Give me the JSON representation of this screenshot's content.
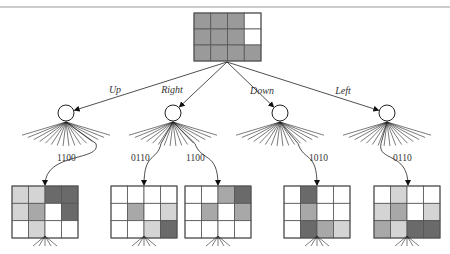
{
  "shade_colors": {
    "W": "#ffffff",
    "L": "#d4d4d4",
    "M": "#a8a8a8",
    "G": "#9a9a9a",
    "D": "#6a6a6a"
  },
  "root": {
    "name": "root-state",
    "x": 194,
    "y": 13,
    "w": 67,
    "h": 48,
    "cells": [
      [
        "G",
        "G",
        "G",
        "W"
      ],
      [
        "G",
        "G",
        "G",
        "W"
      ],
      [
        "G",
        "G",
        "G",
        "G"
      ]
    ],
    "apex": [
      227,
      62
    ]
  },
  "actions": [
    {
      "label": "Up",
      "label_pos": [
        115,
        93
      ],
      "node": [
        66,
        113
      ]
    },
    {
      "label": "Right",
      "label_pos": [
        172,
        93
      ],
      "node": [
        173,
        113
      ]
    },
    {
      "label": "Down",
      "label_pos": [
        262,
        94
      ],
      "node": [
        280,
        113
      ]
    },
    {
      "label": "Left",
      "label_pos": [
        343,
        94
      ],
      "node": [
        387,
        113
      ]
    }
  ],
  "node_radius": 8,
  "fan": {
    "half_width": 44,
    "drop": 24,
    "count": 16
  },
  "branches": [
    {
      "node": 0,
      "code": "1100",
      "code_pos": [
        57,
        161
      ],
      "from_offset": 30,
      "target": 0
    },
    {
      "node": 1,
      "code": "0110",
      "code_pos": [
        131,
        161
      ],
      "from_offset": -12,
      "target": 1
    },
    {
      "node": 1,
      "code": "1100",
      "code_pos": [
        186,
        161
      ],
      "from_offset": 22,
      "target": 2
    },
    {
      "node": 2,
      "code": "1010",
      "code_pos": [
        309,
        161
      ],
      "from_offset": 18,
      "target": 3
    },
    {
      "node": 3,
      "code": "0110",
      "code_pos": [
        393,
        161
      ],
      "from_offset": -6,
      "target": 4
    }
  ],
  "children": [
    {
      "name": "child-up",
      "x": 12,
      "y": 186,
      "w": 66,
      "h": 52,
      "arrow_x": 45,
      "cells": [
        [
          "L",
          "L",
          "D",
          "D"
        ],
        [
          "L",
          "M",
          "W",
          "D"
        ],
        [
          "W",
          "L",
          "W",
          "W"
        ]
      ]
    },
    {
      "name": "child-right-a",
      "x": 111,
      "y": 186,
      "w": 66,
      "h": 52,
      "arrow_x": 144,
      "cells": [
        [
          "W",
          "W",
          "W",
          "W"
        ],
        [
          "W",
          "M",
          "W",
          "L"
        ],
        [
          "W",
          "W",
          "L",
          "D"
        ]
      ]
    },
    {
      "name": "child-right-b",
      "x": 185,
      "y": 186,
      "w": 66,
      "h": 52,
      "arrow_x": 218,
      "cells": [
        [
          "W",
          "W",
          "M",
          "D"
        ],
        [
          "W",
          "M",
          "W",
          "M"
        ],
        [
          "W",
          "W",
          "W",
          "W"
        ]
      ]
    },
    {
      "name": "child-down",
      "x": 284,
      "y": 186,
      "w": 66,
      "h": 52,
      "arrow_x": 317,
      "cells": [
        [
          "W",
          "D",
          "W",
          "W"
        ],
        [
          "W",
          "M",
          "W",
          "W"
        ],
        [
          "W",
          "D",
          "M",
          "L"
        ]
      ]
    },
    {
      "name": "child-left",
      "x": 374,
      "y": 186,
      "w": 66,
      "h": 52,
      "arrow_x": 408,
      "cells": [
        [
          "W",
          "L",
          "W",
          "W"
        ],
        [
          "L",
          "M",
          "W",
          "L"
        ],
        [
          "M",
          "L",
          "D",
          "D"
        ]
      ]
    }
  ]
}
